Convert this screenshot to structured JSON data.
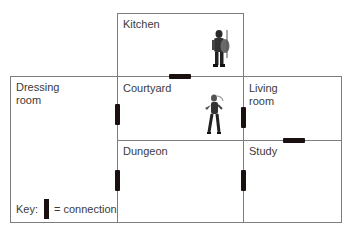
{
  "diagram": {
    "type": "floor-plan",
    "rooms": [
      {
        "id": "kitchen",
        "label": "Kitchen"
      },
      {
        "id": "dressing",
        "label": "Dressing\nroom"
      },
      {
        "id": "courtyard",
        "label": "Courtyard"
      },
      {
        "id": "living",
        "label": "Living\nroom"
      },
      {
        "id": "dungeon",
        "label": "Dungeon"
      },
      {
        "id": "study",
        "label": "Study"
      }
    ],
    "connections": [
      {
        "from": "Kitchen",
        "to": "Courtyard"
      },
      {
        "from": "Dressing room",
        "to": "Courtyard"
      },
      {
        "from": "Courtyard",
        "to": "Living room"
      },
      {
        "from": "Living room",
        "to": "Study"
      },
      {
        "from": "Dressing room",
        "to": "Dungeon"
      },
      {
        "from": "Dungeon",
        "to": "Study"
      }
    ],
    "characters": [
      {
        "room": "Kitchen",
        "icon": "armored-knight-icon"
      },
      {
        "room": "Courtyard",
        "icon": "warrior-woman-icon"
      }
    ],
    "key": {
      "prefix": "Key:",
      "suffix": "= connection"
    },
    "colors": {
      "wall": "#7d7d7d",
      "connection": "#1a1010",
      "text": "#3b3b3b"
    }
  }
}
